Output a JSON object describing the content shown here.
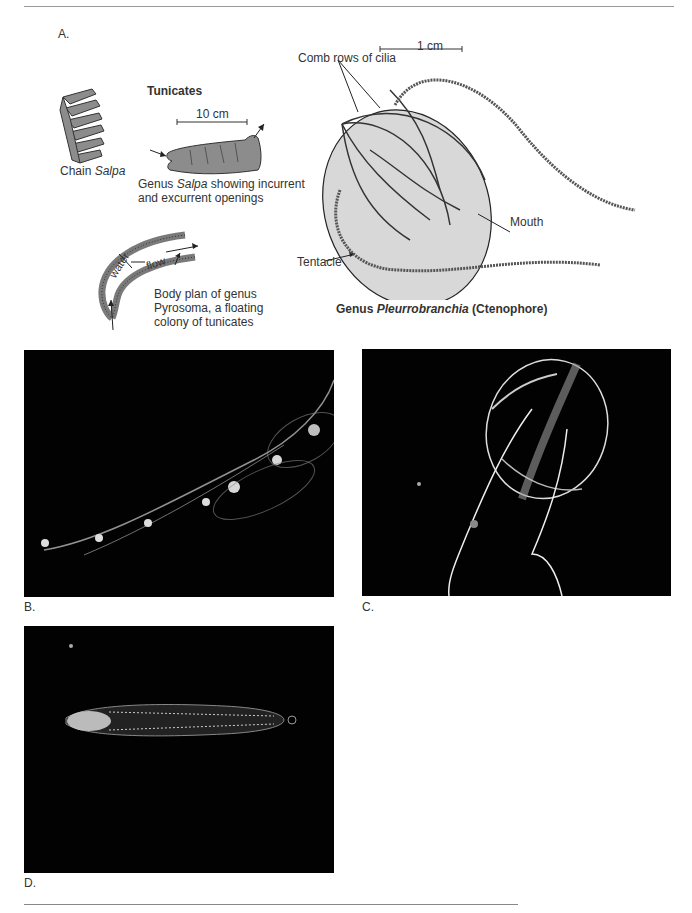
{
  "panel_a": {
    "letter": "A.",
    "tunicates": {
      "heading": "Tunicates",
      "chain_salpa_label": "Chain ",
      "chain_salpa_genus": "Salpa",
      "scale_10cm": "10 cm",
      "salpa_caption_prefix": "Genus ",
      "salpa_caption_genus": "Salpa",
      "salpa_caption_rest": " showing incurrent",
      "salpa_caption_line2": "and excurrent openings",
      "pyrosoma_water": "water",
      "pyrosoma_flow": "flow",
      "pyrosoma_caption_line1": "Body plan of genus",
      "pyrosoma_caption_line2": "Pyrosoma, a floating",
      "pyrosoma_caption_line3": "colony of tunicates"
    },
    "ctenophore": {
      "scale_1cm": "1 cm",
      "comb_rows_label": "Comb rows of cilia",
      "mouth_label": "Mouth",
      "tentacle_label": "Tentacle",
      "caption_prefix": "Genus ",
      "caption_genus": "Pleurrobranchia",
      "caption_suffix": " (Ctenophore)"
    }
  },
  "photos": {
    "b_letter": "B.",
    "c_letter": "C.",
    "d_letter": "D."
  },
  "colors": {
    "photo_bg": "#020202",
    "drawing_fill": "#d8d8d8",
    "salpa_fill": "#8c8c8c"
  }
}
